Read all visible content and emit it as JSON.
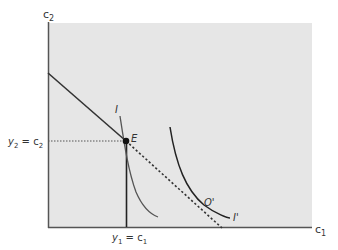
{
  "diagram": {
    "y_axis_label": "c",
    "y_axis_sub": "2",
    "x_axis_label": "c",
    "x_axis_sub": "1",
    "left_label": {
      "a": "y",
      "a_sub": "2",
      "eq": " = c",
      "b_sub": "2"
    },
    "bottom_label": {
      "a": "y",
      "a_sub": "1",
      "eq": " = c",
      "b_sub": "1"
    },
    "point_E": "E",
    "point_O": "O'",
    "curve_I": "I",
    "curve_I_prime": "I'",
    "colors": {
      "panel": "#e6e6e6",
      "axis": "#555555",
      "line": "#333333",
      "curve_I": "#555555"
    }
  }
}
